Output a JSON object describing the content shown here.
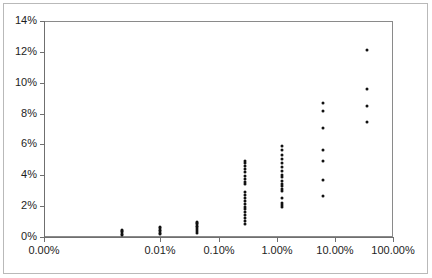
{
  "chart_data": {
    "type": "scatter",
    "title": "",
    "subtitle": "",
    "xlabel": "",
    "ylabel": "",
    "xscale": "log",
    "yscale": "linear",
    "grid": false,
    "legend": null,
    "legend_position": "none",
    "xlim": [
      0.0001,
      100
    ],
    "ylim": [
      0,
      14
    ],
    "x_tick_labels": [
      "0.00%",
      "0.01%",
      "0.10%",
      "1.00%",
      "10.00%",
      "100.00%"
    ],
    "x_tick_values": [
      0.0001,
      0.01,
      0.1,
      1,
      10,
      100
    ],
    "y_tick_labels": [
      "0%",
      "2%",
      "4%",
      "6%",
      "8%",
      "10%",
      "12%",
      "14%"
    ],
    "y_tick_values": [
      0,
      2,
      4,
      6,
      8,
      10,
      12,
      14
    ],
    "x_unit": "percent",
    "y_unit": "percent",
    "series": [
      {
        "name": "observations",
        "marker": "circle",
        "color": "#111111",
        "points": [
          {
            "x": 0.0022,
            "y": 0.15
          },
          {
            "x": 0.0022,
            "y": 0.22
          },
          {
            "x": 0.0022,
            "y": 0.3
          },
          {
            "x": 0.0022,
            "y": 0.38
          },
          {
            "x": 0.0022,
            "y": 0.46
          },
          {
            "x": 0.0098,
            "y": 0.18
          },
          {
            "x": 0.0098,
            "y": 0.28
          },
          {
            "x": 0.0098,
            "y": 0.38
          },
          {
            "x": 0.0098,
            "y": 0.48
          },
          {
            "x": 0.0098,
            "y": 0.58
          },
          {
            "x": 0.0098,
            "y": 0.66
          },
          {
            "x": 0.042,
            "y": 0.28
          },
          {
            "x": 0.042,
            "y": 0.4
          },
          {
            "x": 0.042,
            "y": 0.52
          },
          {
            "x": 0.042,
            "y": 0.62
          },
          {
            "x": 0.042,
            "y": 0.72
          },
          {
            "x": 0.042,
            "y": 0.82
          },
          {
            "x": 0.042,
            "y": 0.92
          },
          {
            "x": 0.042,
            "y": 1.0
          },
          {
            "x": 0.29,
            "y": 0.82
          },
          {
            "x": 0.29,
            "y": 1.05
          },
          {
            "x": 0.29,
            "y": 1.25
          },
          {
            "x": 0.29,
            "y": 1.45
          },
          {
            "x": 0.29,
            "y": 1.62
          },
          {
            "x": 0.29,
            "y": 1.8
          },
          {
            "x": 0.29,
            "y": 1.98
          },
          {
            "x": 0.29,
            "y": 2.15
          },
          {
            "x": 0.29,
            "y": 2.35
          },
          {
            "x": 0.29,
            "y": 2.55
          },
          {
            "x": 0.29,
            "y": 2.72
          },
          {
            "x": 0.29,
            "y": 2.9
          },
          {
            "x": 0.29,
            "y": 3.42
          },
          {
            "x": 0.29,
            "y": 3.6
          },
          {
            "x": 0.29,
            "y": 3.78
          },
          {
            "x": 0.29,
            "y": 3.98
          },
          {
            "x": 0.29,
            "y": 4.22
          },
          {
            "x": 0.29,
            "y": 4.4
          },
          {
            "x": 0.29,
            "y": 4.58
          },
          {
            "x": 0.29,
            "y": 4.78
          },
          {
            "x": 0.29,
            "y": 4.92
          },
          {
            "x": 1.25,
            "y": 1.95
          },
          {
            "x": 1.25,
            "y": 2.05
          },
          {
            "x": 1.25,
            "y": 2.18
          },
          {
            "x": 1.25,
            "y": 2.55
          },
          {
            "x": 1.25,
            "y": 3.0
          },
          {
            "x": 1.25,
            "y": 3.12
          },
          {
            "x": 1.25,
            "y": 3.28
          },
          {
            "x": 1.25,
            "y": 3.45
          },
          {
            "x": 1.25,
            "y": 3.62
          },
          {
            "x": 1.25,
            "y": 3.88
          },
          {
            "x": 1.25,
            "y": 4.02
          },
          {
            "x": 1.25,
            "y": 4.28
          },
          {
            "x": 1.25,
            "y": 4.52
          },
          {
            "x": 1.25,
            "y": 4.78
          },
          {
            "x": 1.25,
            "y": 5.08
          },
          {
            "x": 1.25,
            "y": 5.35
          },
          {
            "x": 1.25,
            "y": 5.62
          },
          {
            "x": 1.25,
            "y": 5.92
          },
          {
            "x": 6.2,
            "y": 2.68
          },
          {
            "x": 6.2,
            "y": 3.72
          },
          {
            "x": 6.2,
            "y": 4.9
          },
          {
            "x": 6.2,
            "y": 5.62
          },
          {
            "x": 6.2,
            "y": 7.05
          },
          {
            "x": 6.2,
            "y": 8.18
          },
          {
            "x": 6.2,
            "y": 8.7
          },
          {
            "x": 35,
            "y": 7.48
          },
          {
            "x": 35,
            "y": 8.48
          },
          {
            "x": 35,
            "y": 9.62
          },
          {
            "x": 35,
            "y": 12.15
          }
        ]
      }
    ]
  },
  "axes": {
    "x_labels": [
      "0.00%",
      "0.01%",
      "0.10%",
      "1.00%",
      "10.00%",
      "100.00%"
    ],
    "y_labels": [
      "0%",
      "2%",
      "4%",
      "6%",
      "8%",
      "10%",
      "12%",
      "14%"
    ]
  }
}
